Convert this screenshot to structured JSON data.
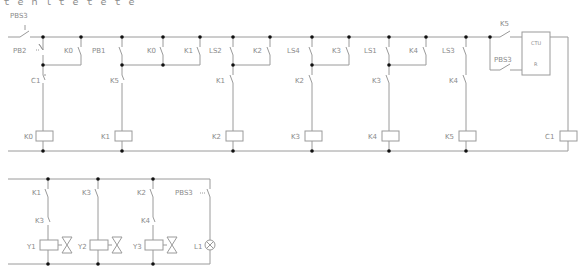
{
  "header": {
    "clipped_title": "ｔ ｅ ｎ ｌ ｔ ｅ  ｔ ｅ  ｔ ｅ"
  },
  "colors": {
    "wire": "#9a9a9a",
    "node": "#111111",
    "label": "#8a8a8a",
    "component": "#9a9a9a"
  },
  "rung1": {
    "start_contact": "PBS3",
    "branches": [
      {
        "parallel_a": "PB2",
        "parallel_b": "K0",
        "series": "C1",
        "coil": "K0"
      },
      {
        "parallel_a": "PB1",
        "parallel_b": "K0",
        "series": "K5",
        "coil": "K1"
      },
      {
        "parallel_a": "K1",
        "parallel_b": "LS2",
        "parallel_c": "K2",
        "series": "K1",
        "coil": "K2"
      },
      {
        "parallel_a": "LS4",
        "parallel_b": "K3",
        "series": "K2",
        "coil": "K3"
      },
      {
        "parallel_a": "LS1",
        "parallel_b": "K4",
        "series": "K3",
        "coil": "K4"
      },
      {
        "parallel_a": "LS3",
        "series": "K4",
        "coil": "K5"
      },
      {
        "counter_input_a": "K5",
        "counter_input_b": "PBS3",
        "counter_type": "CTU",
        "counter_reset": "R",
        "coil": "C1"
      }
    ]
  },
  "rung2": {
    "branches": [
      {
        "contact_a": "K1",
        "contact_b": "K3",
        "output": "Y1",
        "output_type": "valve"
      },
      {
        "contact_a": "K3",
        "output": "Y2",
        "output_type": "valve"
      },
      {
        "contact_a": "K2",
        "contact_b": "K4",
        "output": "Y3",
        "output_type": "valve"
      },
      {
        "contact_a": "PBS3",
        "output": "L1",
        "output_type": "lamp"
      }
    ]
  },
  "labels": {
    "PBS3_top": "PBS3",
    "PB2": "PB2",
    "K0_a": "K0",
    "C1_series": "C1",
    "K0_coil": "K0",
    "PB1": "PB1",
    "K0_b": "K0",
    "K5_series": "K5",
    "K1_coil": "K1",
    "K1_par": "K1",
    "LS2": "LS2",
    "K2_par": "K2",
    "K1_series": "K1",
    "K2_coil": "K2",
    "LS4": "LS4",
    "K3_par": "K3",
    "K2_series": "K2",
    "K3_coil": "K3",
    "LS1": "LS1",
    "K4_par": "K4",
    "K3_series": "K3",
    "K4_coil": "K4",
    "LS3": "LS3",
    "K4_series": "K4",
    "K5_coil": "K5",
    "K5_cnt": "K5",
    "PBS3_cnt": "PBS3",
    "CTU": "CTU",
    "R": "R",
    "C1_coil": "C1",
    "r2_K1": "K1",
    "r2_K3a": "K3",
    "r2_Y1": "Y1",
    "r2_K3b": "K3",
    "r2_Y2": "Y2",
    "r2_K2": "K2",
    "r2_K4": "K4",
    "r2_Y3": "Y3",
    "r2_PBS3": "PBS3",
    "r2_L1": "L1"
  }
}
